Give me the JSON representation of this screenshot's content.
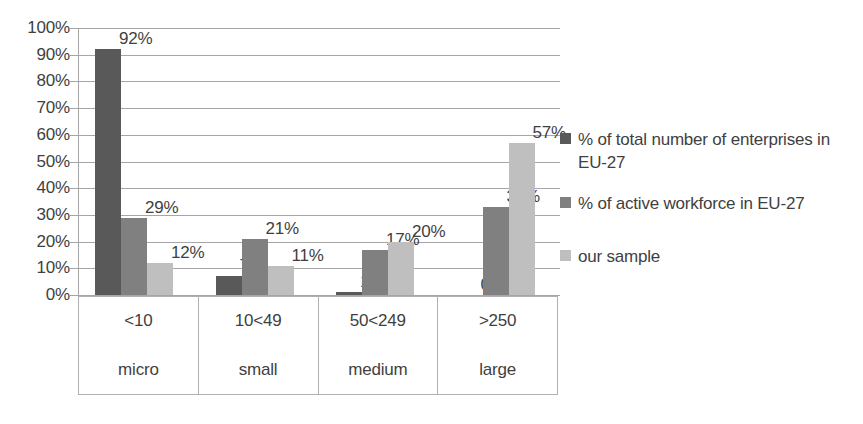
{
  "chart_data": {
    "type": "bar",
    "title": "",
    "subtitle": "",
    "xlabel": "",
    "ylabel": "",
    "ylim": [
      0,
      100
    ],
    "grid": true,
    "legend_position": "right",
    "categories": [
      "<10",
      "10<49",
      "50<249",
      ">250"
    ],
    "category_sublabels": [
      "micro",
      "small",
      "medium",
      "large"
    ],
    "ytick_labels": [
      "0%",
      "10%",
      "20%",
      "30%",
      "40%",
      "50%",
      "60%",
      "70%",
      "80%",
      "90%",
      "100%"
    ],
    "ytick_values": [
      0,
      10,
      20,
      30,
      40,
      50,
      60,
      70,
      80,
      90,
      100
    ],
    "series": [
      {
        "name": "% of total number of enterprises in EU-27",
        "color": "#595959",
        "values": [
          92,
          7,
          1,
          0
        ],
        "data_labels": [
          "92%",
          "7%",
          "1%",
          "0%"
        ]
      },
      {
        "name": "% of active workforce in EU-27",
        "color": "#808080",
        "values": [
          29,
          21,
          17,
          33
        ],
        "data_labels": [
          "29%",
          "21%",
          "17%",
          "33%"
        ]
      },
      {
        "name": "our sample",
        "color": "#bfbfbf",
        "values": [
          12,
          11,
          20,
          57
        ],
        "data_labels": [
          "12%",
          "11%",
          "20%",
          "57%"
        ]
      }
    ]
  },
  "legend": {
    "items": [
      {
        "label": "% of total number of enterprises in EU-27",
        "color": "#595959"
      },
      {
        "label": "% of active workforce in EU-27",
        "color": "#808080"
      },
      {
        "label": "our sample",
        "color": "#bfbfbf"
      }
    ]
  },
  "colors": {
    "series_1": "#595959",
    "series_2": "#808080",
    "series_3": "#bfbfbf",
    "gridline": "#a6a6a6",
    "text": "#3f3f3f",
    "table_border": "#b0b0b0",
    "background": "#ffffff"
  }
}
